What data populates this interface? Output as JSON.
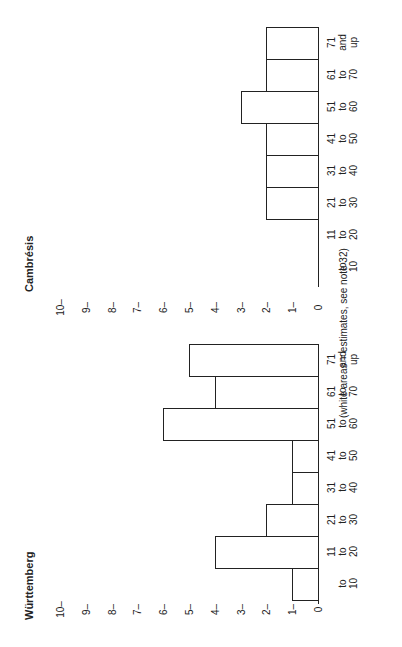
{
  "chart_data": [
    {
      "type": "bar",
      "orientation": "horizontal (figure rotated 90°)",
      "title": "Cambrésis",
      "categories": [
        "to 10",
        "11 to 20",
        "21 to 30",
        "31 to 40",
        "41 to 50",
        "51 to 60",
        "61 to 70",
        "71 and up"
      ],
      "values": [
        0,
        0,
        2,
        2,
        2,
        3,
        2,
        2
      ],
      "xlabel": "",
      "ylabel": "",
      "ylim": [
        0,
        10
      ],
      "yticks": [
        "0",
        "1",
        "2",
        "3",
        "4",
        "5",
        "6",
        "7",
        "8",
        "9",
        "10"
      ],
      "grid": false
    },
    {
      "type": "bar",
      "orientation": "horizontal (figure rotated 90°)",
      "title": "Württemberg",
      "categories": [
        "to 10",
        "11 to 20",
        "21 to 30",
        "31 to 40",
        "41 to 50",
        "51 to 60",
        "61 to 70",
        "71 and up"
      ],
      "values": [
        1,
        4,
        2,
        1,
        1,
        6,
        4,
        5
      ],
      "xlabel": "",
      "ylabel": "",
      "ylim": [
        0,
        10
      ],
      "yticks": [
        "0",
        "1",
        "2",
        "3",
        "4",
        "5",
        "6",
        "7",
        "8",
        "9",
        "10"
      ],
      "grid": false
    }
  ],
  "charts": [
    {
      "title": "Cambrésis",
      "categories": [
        {
          "l1": "",
          "l2": "to",
          "l3": "10"
        },
        {
          "l1": "11",
          "l2": "to",
          "l3": "20"
        },
        {
          "l1": "21",
          "l2": "to",
          "l3": "30"
        },
        {
          "l1": "31",
          "l2": "to",
          "l3": "40"
        },
        {
          "l1": "41",
          "l2": "to",
          "l3": "50"
        },
        {
          "l1": "51",
          "l2": "to",
          "l3": "60"
        },
        {
          "l1": "61",
          "l2": "to",
          "l3": "70"
        },
        {
          "l1": "71",
          "l2": "and",
          "l3": "up"
        }
      ],
      "values": [
        0,
        0,
        2,
        2,
        2,
        3,
        2,
        2
      ]
    },
    {
      "title": "Württemberg",
      "categories": [
        {
          "l1": "",
          "l2": "to",
          "l3": "10"
        },
        {
          "l1": "11",
          "l2": "to",
          "l3": "20"
        },
        {
          "l1": "21",
          "l2": "to",
          "l3": "30"
        },
        {
          "l1": "31",
          "l2": "to",
          "l3": "40"
        },
        {
          "l1": "41",
          "l2": "to",
          "l3": "50"
        },
        {
          "l1": "51",
          "l2": "to",
          "l3": "60"
        },
        {
          "l1": "61",
          "l2": "to",
          "l3": "70"
        },
        {
          "l1": "71",
          "l2": "and",
          "l3": "up"
        }
      ],
      "values": [
        1,
        4,
        2,
        1,
        1,
        6,
        4,
        5
      ]
    }
  ],
  "ticks": [
    "0",
    "1–",
    "2–",
    "3–",
    "4–",
    "5–",
    "6–",
    "7–",
    "8–",
    "9–",
    "10–"
  ],
  "note": "(white areas = estimates, see note 32)"
}
